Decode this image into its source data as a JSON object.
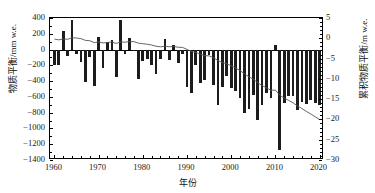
{
  "chart_data": {
    "type": "bar",
    "title": "",
    "xlabel": "年份",
    "ylabel": "物质平衡/mm w.e.",
    "y2label": "累积物质平衡/m w.e.",
    "xlim": [
      1959,
      2021
    ],
    "ylim": [
      -1400,
      400
    ],
    "y2lim": [
      -30,
      5
    ],
    "grid": false,
    "legend": null,
    "xticks": [
      1960,
      1970,
      1980,
      1990,
      2000,
      2010,
      2020
    ],
    "xtick_labels": [
      "1960",
      "1970",
      "1980",
      "1990",
      "2000",
      "2010",
      "2020"
    ],
    "xminor_step": 2,
    "yticks": [
      400,
      200,
      0,
      -200,
      -400,
      -600,
      -800,
      -1000,
      -1200,
      -1400
    ],
    "ytick_labels": [
      "400",
      "200",
      "0",
      "-200",
      "-400",
      "-600",
      "-800",
      "-1000",
      "-1200",
      "-1400"
    ],
    "y2ticks": [
      5,
      0,
      -5,
      -10,
      -15,
      -20,
      -25,
      -30
    ],
    "y2tick_labels": [
      "5",
      "0",
      "-5",
      "-10",
      "-15",
      "-20",
      "-25",
      "-30"
    ],
    "bar_color": "#1c1c1c",
    "line_color": "#555555",
    "series": [
      {
        "name": "年物质平衡",
        "type": "bar",
        "axis": "left",
        "unit": "mm w.e.",
        "x": [
          1960,
          1961,
          1962,
          1963,
          1964,
          1965,
          1966,
          1967,
          1968,
          1969,
          1970,
          1971,
          1972,
          1973,
          1974,
          1975,
          1976,
          1977,
          1978,
          1979,
          1980,
          1981,
          1982,
          1983,
          1984,
          1985,
          1986,
          1987,
          1988,
          1989,
          1990,
          1991,
          1992,
          1993,
          1994,
          1995,
          1996,
          1997,
          1998,
          1999,
          2000,
          2001,
          2002,
          2003,
          2004,
          2005,
          2006,
          2007,
          2008,
          2009,
          2010,
          2011,
          2012,
          2013,
          2014,
          2015,
          2016,
          2017,
          2018,
          2019,
          2020
        ],
        "values": [
          -190,
          -200,
          230,
          -80,
          375,
          -60,
          -160,
          -415,
          -90,
          -465,
          155,
          -230,
          95,
          115,
          -350,
          380,
          -60,
          145,
          -20,
          -370,
          -140,
          -120,
          -195,
          -310,
          -120,
          130,
          -130,
          60,
          -170,
          -60,
          -480,
          -545,
          -190,
          -420,
          -380,
          -70,
          -450,
          -700,
          -480,
          -330,
          -490,
          -525,
          -620,
          -810,
          -750,
          -575,
          -890,
          -700,
          -555,
          -610,
          60,
          -1270,
          -680,
          -590,
          -595,
          -760,
          -660,
          -690,
          -635,
          -680,
          -700
        ]
      },
      {
        "name": "累积物质平衡",
        "type": "line",
        "axis": "right",
        "unit": "m w.e.",
        "x": [
          1960,
          1961,
          1962,
          1963,
          1964,
          1965,
          1966,
          1967,
          1968,
          1969,
          1970,
          1971,
          1972,
          1973,
          1974,
          1975,
          1976,
          1977,
          1978,
          1979,
          1980,
          1981,
          1982,
          1983,
          1984,
          1985,
          1986,
          1987,
          1988,
          1989,
          1990,
          1991,
          1992,
          1993,
          1994,
          1995,
          1996,
          1997,
          1998,
          1999,
          2000,
          2001,
          2002,
          2003,
          2004,
          2005,
          2006,
          2007,
          2008,
          2009,
          2010,
          2011,
          2012,
          2013,
          2014,
          2015,
          2016,
          2017,
          2018,
          2019,
          2020
        ],
        "values": [
          -0.19,
          -0.39,
          -0.16,
          -0.24,
          0.13,
          0.07,
          -0.09,
          -0.51,
          -0.6,
          -1.06,
          -0.91,
          -1.14,
          -1.04,
          -0.93,
          -1.28,
          -0.9,
          -0.96,
          -0.81,
          -0.83,
          -1.2,
          -1.34,
          -1.46,
          -1.66,
          -1.97,
          -2.09,
          -1.96,
          -2.09,
          -2.03,
          -2.2,
          -2.26,
          -2.74,
          -3.28,
          -3.47,
          -3.89,
          -4.27,
          -4.34,
          -4.79,
          -5.49,
          -5.97,
          -6.3,
          -6.79,
          -7.32,
          -7.94,
          -8.75,
          -9.5,
          -10.07,
          -10.96,
          -11.66,
          -12.22,
          -12.83,
          -12.77,
          -14.04,
          -14.72,
          -15.31,
          -15.9,
          -16.66,
          -17.32,
          -18.01,
          -18.65,
          -19.33,
          -20.03
        ]
      }
    ]
  }
}
